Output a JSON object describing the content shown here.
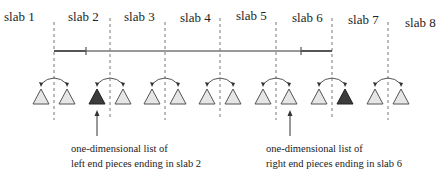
{
  "diagram": {
    "title": "",
    "slabs": [
      {
        "label": "slab 1"
      },
      {
        "label": "slab 2"
      },
      {
        "label": "slab 3"
      },
      {
        "label": "slab 4"
      },
      {
        "label": "slab 5"
      },
      {
        "label": "slab 6"
      },
      {
        "label": "slab 7"
      },
      {
        "label": "slab 8"
      }
    ],
    "segment": {
      "from_boundary": 1,
      "to_boundary": 5,
      "start_slab": 2,
      "end_slab": 6
    },
    "trees": [
      {
        "boundary": 1,
        "left_highlight": false,
        "right_highlight": false
      },
      {
        "boundary": 2,
        "left_highlight": true,
        "right_highlight": false
      },
      {
        "boundary": 3,
        "left_highlight": false,
        "right_highlight": false
      },
      {
        "boundary": 4,
        "left_highlight": false,
        "right_highlight": false
      },
      {
        "boundary": 5,
        "left_highlight": false,
        "right_highlight": false
      },
      {
        "boundary": 6,
        "left_highlight": false,
        "right_highlight": true
      },
      {
        "boundary": 7,
        "left_highlight": false,
        "right_highlight": false
      }
    ],
    "annotations": [
      {
        "points_to": "left child at slab boundary 2",
        "lines": [
          "one-dimensional list of",
          "left end pieces ending in slab 2"
        ]
      },
      {
        "points_to": "right child at slab boundary 6",
        "lines": [
          "one-dimensional list of",
          "right end pieces ending in slab 6"
        ]
      }
    ],
    "colors": {
      "light_triangle": "#e6e6e6",
      "dark_triangle": "#3c3c3c",
      "stroke": "#555555",
      "segment": "#777777",
      "segment_end": "#555555",
      "dashed": "#777777"
    }
  }
}
